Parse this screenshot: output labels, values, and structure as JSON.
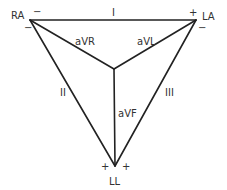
{
  "diagram": {
    "vertices": {
      "ra": {
        "label": "RA",
        "x": 30,
        "y": 20
      },
      "la": {
        "label": "LA",
        "x": 196,
        "y": 20
      },
      "ll": {
        "label": "LL",
        "x": 115,
        "y": 166
      }
    },
    "center": {
      "x": 114,
      "y": 69
    },
    "leads": {
      "lead_i": {
        "label": "I"
      },
      "lead_ii": {
        "label": "II"
      },
      "lead_iii": {
        "label": "III"
      },
      "avr": {
        "label": "aVR"
      },
      "avl": {
        "label": "aVL"
      },
      "avf": {
        "label": "aVF"
      }
    },
    "polarity": {
      "ra_top": "−",
      "ra_bottom": "−",
      "la_top": "+",
      "la_bottom": "−",
      "ll_left": "+",
      "ll_right": "+"
    },
    "colors": {
      "line": "#222222",
      "text": "#333333",
      "background": "#ffffff"
    }
  }
}
